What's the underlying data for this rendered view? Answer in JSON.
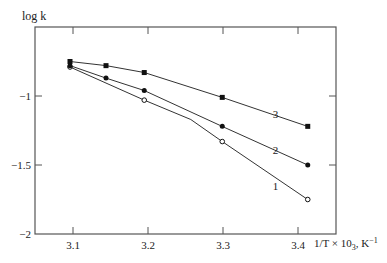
{
  "chart_data": {
    "type": "line",
    "title": "",
    "xlabel": "1/T × 10³, K⁻¹",
    "ylabel": "log k",
    "xlim": [
      3.05,
      3.45
    ],
    "ylim": [
      -2.0,
      -0.5
    ],
    "x_ticks": [
      3.1,
      3.2,
      3.3,
      3.4
    ],
    "x_tick_labels": [
      "3.1",
      "3.2",
      "3.3",
      "3.4"
    ],
    "y_ticks": [
      -1.0,
      -1.5,
      -2.0
    ],
    "y_tick_labels": [
      "−1",
      "−1.5",
      "−2"
    ],
    "grid": false,
    "legend": "inline curve numbers",
    "series": [
      {
        "name": "1",
        "marker": "open-circle",
        "x": [
          3.096,
          3.195,
          3.299,
          3.413
        ],
        "y": [
          -0.79,
          -1.03,
          -1.33,
          -1.75
        ],
        "line_path": [
          [
            3.096,
            -0.79
          ],
          [
            3.195,
            -1.03
          ],
          [
            3.257,
            -1.17
          ],
          [
            3.299,
            -1.33
          ],
          [
            3.413,
            -1.75
          ]
        ],
        "label_pos": [
          3.37,
          -1.68
        ]
      },
      {
        "name": "2",
        "marker": "filled-circle",
        "x": [
          3.096,
          3.144,
          3.195,
          3.299,
          3.413
        ],
        "y": [
          -0.78,
          -0.87,
          -0.96,
          -1.22,
          -1.5
        ],
        "line_path": [
          [
            3.096,
            -0.78
          ],
          [
            3.144,
            -0.87
          ],
          [
            3.195,
            -0.96
          ],
          [
            3.299,
            -1.22
          ],
          [
            3.413,
            -1.5
          ]
        ],
        "label_pos": [
          3.37,
          -1.42
        ]
      },
      {
        "name": "3",
        "marker": "filled-square",
        "x": [
          3.096,
          3.144,
          3.195,
          3.299,
          3.413
        ],
        "y": [
          -0.75,
          -0.78,
          -0.83,
          -1.01,
          -1.22
        ],
        "line_path": [
          [
            3.096,
            -0.75
          ],
          [
            3.144,
            -0.78
          ],
          [
            3.195,
            -0.83
          ],
          [
            3.299,
            -1.01
          ],
          [
            3.413,
            -1.22
          ]
        ],
        "label_pos": [
          3.37,
          -1.16
        ]
      }
    ]
  },
  "axes": {
    "ylabel_text": "log k",
    "xlabel_text": "1/T × 10",
    "xlabel_sub": "3",
    "xlabel_unit": ", K",
    "xlabel_sup": "−1"
  },
  "colors": {
    "line": "#333333",
    "axis": "#555555",
    "text": "#222222"
  }
}
